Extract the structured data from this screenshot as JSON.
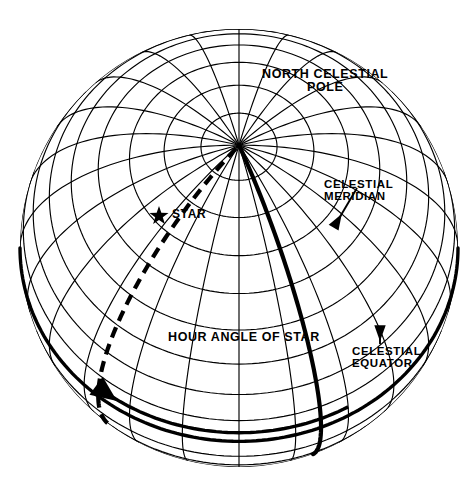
{
  "diagram": {
    "type": "astronomical-celestial-sphere",
    "background_color": "#ffffff",
    "line_color": "#000000",
    "sphere": {
      "center_x": 239,
      "center_y": 248,
      "radius": 219,
      "outline_visible": false,
      "grid": {
        "parallel_spacing_deg": 10,
        "meridian_spacing_deg": 15,
        "parallel_count": 17,
        "meridian_count": 24
      },
      "view_tilt_deg": 62
    },
    "labels": {
      "north_celestial_pole": {
        "line1": "NORTH CELESTIAL",
        "line2": "POLE",
        "x": 262,
        "y": 68
      },
      "celestial_meridian": {
        "line1": "CELESTIAL",
        "line2": "MERIDIAN",
        "x": 324,
        "y": 178
      },
      "celestial_equator": {
        "line1": "CELESTIAL",
        "line2": "EQUATOR",
        "x": 352,
        "y": 345
      },
      "star": {
        "text": "STAR",
        "x": 172,
        "y": 208
      },
      "hour_angle": {
        "text": "HOUR ANGLE OF STAR",
        "x": 168,
        "y": 331
      }
    },
    "markers": {
      "star_symbol": {
        "name": "star-marker",
        "x": 159,
        "y": 216,
        "points": 5,
        "radius": 10
      },
      "pole_point": {
        "x": 240,
        "y": 55
      }
    },
    "features": [
      {
        "name": "celestial-meridian-curve",
        "style": "solid-bold",
        "stroke_width": 4.2,
        "description": "Bold great circle from north celestial pole through the observer's zenith meridian down to the lower limb"
      },
      {
        "name": "star-hour-circle",
        "style": "dashed-bold",
        "stroke_width": 4.2,
        "dash": "11 7",
        "description": "Dashed hour circle of the star running from the pole through the star down past the equator"
      },
      {
        "name": "celestial-equator-curve",
        "style": "solid-bold",
        "stroke_width": 3.4,
        "description": "Bold great circle of the celestial equator"
      },
      {
        "name": "hour-angle-arc",
        "style": "solid-bold-arrow",
        "stroke_width": 3.4,
        "arrowhead": "left",
        "description": "Bold arrowed arc measuring the hour angle from the celestial meridian westward to the star's hour circle"
      },
      {
        "name": "meridian-leader-line",
        "style": "solid-thin-arrow",
        "arrowhead": "down-left",
        "description": "Leader from the CELESTIAL MERIDIAN label to the bold meridian curve"
      },
      {
        "name": "equator-leader-arrow",
        "style": "solid-thin-arrow",
        "arrowhead": "up",
        "description": "Short vertical arrow from the CELESTIAL EQUATOR label up to the equator curve"
      }
    ]
  }
}
